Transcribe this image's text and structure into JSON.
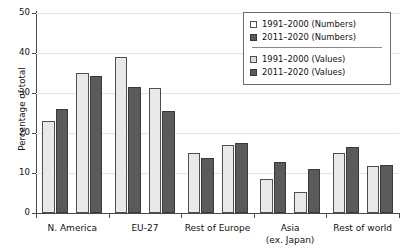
{
  "chart_data": {
    "type": "bar",
    "title": "",
    "xlabel": "",
    "ylabel": "Percentage of total",
    "ylim": [
      0,
      50
    ],
    "yticks": [
      0,
      10,
      20,
      30,
      40,
      50
    ],
    "grid": true,
    "legend_position": "top-right",
    "categories": [
      "N. America",
      "EU-27",
      "Rest of Europe",
      "Asia (ex. Japan)",
      "Rest of world"
    ],
    "category_labels": [
      {
        "line1": "N. America",
        "line2": ""
      },
      {
        "line1": "EU-27",
        "line2": ""
      },
      {
        "line1": "Rest of Europe",
        "line2": ""
      },
      {
        "line1": "Asia",
        "line2": "(ex. Japan)"
      },
      {
        "line1": "Rest of world",
        "line2": ""
      }
    ],
    "series": [
      {
        "name": "1991–2000 (Numbers)",
        "style": "light",
        "values": [
          23.0,
          39.0,
          14.9,
          8.6,
          15.1
        ]
      },
      {
        "name": "2011–2020 (Numbers)",
        "style": "dark",
        "values": [
          26.0,
          31.5,
          13.7,
          12.8,
          16.5
        ]
      },
      {
        "name": "1991–2000 (Values)",
        "style": "light",
        "values": [
          35.0,
          31.3,
          17.0,
          5.3,
          11.8
        ]
      },
      {
        "name": "2011–2020 (Values)",
        "style": "dark",
        "values": [
          34.3,
          25.6,
          17.6,
          11.1,
          12.0
        ]
      }
    ]
  },
  "legend": {
    "entries": [
      {
        "label": "1991–2000 (Numbers)",
        "swatch": "swatch-numbers-light"
      },
      {
        "label": "2011–2020 (Numbers)",
        "swatch": "swatch-numbers-dark"
      },
      {
        "label": "1991–2000 (Values)",
        "swatch": "swatch-values-light"
      },
      {
        "label": "2011–2020 (Values)",
        "swatch": "swatch-values-dark"
      }
    ]
  },
  "colors": {
    "light_bar": "#e9e9e9",
    "dark_bar": "#5a5a5a",
    "axis": "#4a4a4a",
    "grid": "#e3e3e3",
    "text": "#111111"
  }
}
